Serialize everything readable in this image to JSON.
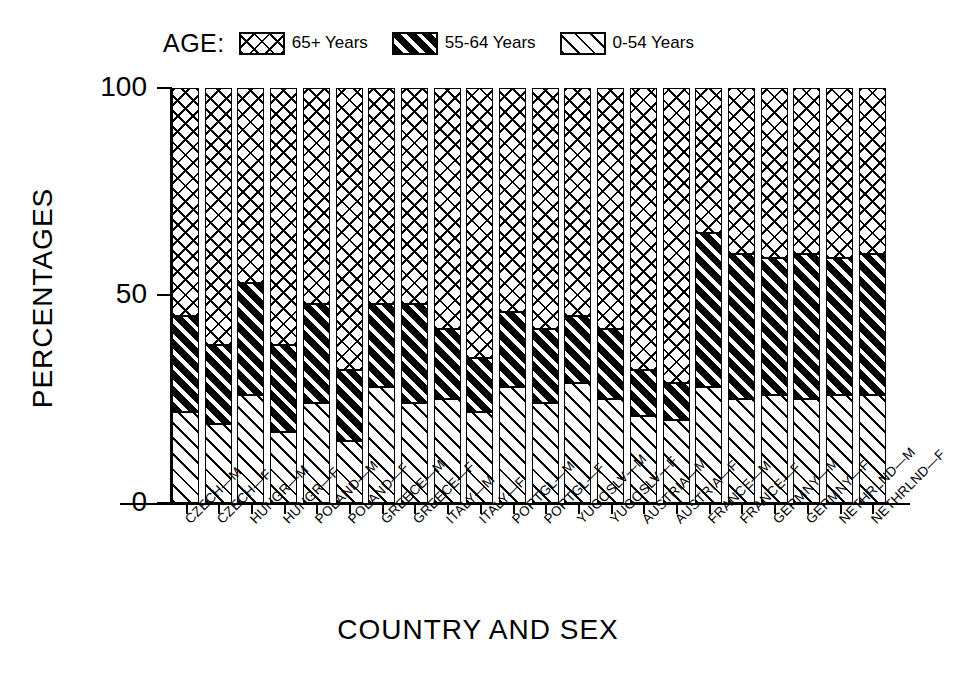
{
  "chart_data": {
    "type": "bar",
    "subtype": "stacked-bar-100-percent",
    "title": "",
    "xlabel": "COUNTRY AND SEX",
    "ylabel": "PERCENTAGES",
    "legend_title": "AGE:",
    "legend_position": "top",
    "grid": false,
    "ylim": [
      0,
      100
    ],
    "yticks": [
      0,
      50,
      100
    ],
    "ytick_labels": [
      "0",
      "50",
      "100"
    ],
    "stack_order_bottom_to_top": [
      "0-54 Years",
      "55-64 Years",
      "65+ Years"
    ],
    "categories": [
      "CZECH—M",
      "CZECH—F",
      "HUNGR—M",
      "HUNGR—F",
      "POLAND—M",
      "POLAND—F",
      "GREECE—M",
      "GREECE—F",
      "ITALY—M",
      "ITALY—F",
      "PORTGL—M",
      "PORTGL—F",
      "YUGOSLV—M",
      "YUGOSLV—F",
      "AUSTRIA—M",
      "AUSTRIA—F",
      "FRANCE—M",
      "FRANCE—F",
      "GERMNY—M",
      "GERMNY—F",
      "NETHRLND—M",
      "NETHRLND—F"
    ],
    "series": [
      {
        "name": "0-54 Years",
        "pattern": "diagonal-hatch-thin",
        "values": [
          22,
          19,
          26,
          17,
          24,
          15,
          28,
          24,
          25,
          22,
          28,
          24,
          29,
          25,
          21,
          20,
          28,
          25,
          26,
          25,
          26,
          26
        ]
      },
      {
        "name": "55-64 Years",
        "pattern": "diagonal-hatch-bold",
        "values": [
          23,
          19,
          27,
          21,
          24,
          17,
          20,
          24,
          17,
          13,
          18,
          18,
          16,
          17,
          11,
          9,
          37,
          35,
          33,
          35,
          33,
          34
        ]
      },
      {
        "name": "65+ Years",
        "pattern": "crosshatch",
        "values": [
          55,
          62,
          47,
          62,
          52,
          68,
          52,
          52,
          58,
          65,
          54,
          58,
          55,
          58,
          68,
          71,
          35,
          40,
          41,
          40,
          41,
          40
        ]
      }
    ],
    "cumulative_tops": {
      "0-54 Years": [
        22,
        19,
        26,
        17,
        24,
        15,
        28,
        24,
        25,
        22,
        28,
        24,
        29,
        25,
        21,
        20,
        28,
        25,
        26,
        25,
        26,
        26
      ],
      "55-64 Years": [
        45,
        38,
        53,
        38,
        48,
        32,
        48,
        48,
        42,
        35,
        46,
        42,
        45,
        42,
        32,
        29,
        65,
        60,
        59,
        60,
        59,
        60
      ]
    }
  },
  "legend": {
    "title": "AGE:",
    "entries": [
      {
        "label": "65+ Years",
        "icon": "crosshatch-swatch-icon"
      },
      {
        "label": "55-64 Years",
        "icon": "bold-hatch-swatch-icon"
      },
      {
        "label": "0-54 Years",
        "icon": "thin-hatch-swatch-icon"
      }
    ]
  },
  "axes": {
    "y_title": "PERCENTAGES",
    "x_title": "COUNTRY AND SEX",
    "y_tick_labels": [
      "100",
      "50",
      "0"
    ]
  },
  "colors": {
    "ink": "#000000",
    "background": "#ffffff"
  }
}
